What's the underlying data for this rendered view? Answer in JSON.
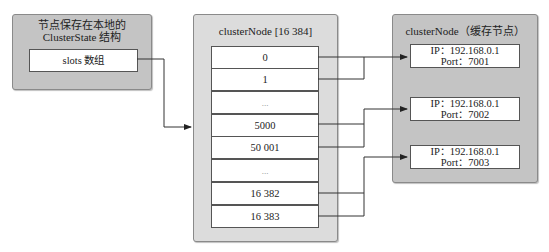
{
  "left_panel": {
    "title_line1": "节点保存在本地的",
    "title_line2": "ClusterState 结构",
    "slots_label": "slots 数组"
  },
  "middle_panel": {
    "title": "clusterNode [16 384]",
    "cells": [
      "0",
      "1",
      "...",
      "5000",
      "50 001",
      "...",
      "16 382",
      "16 383"
    ]
  },
  "right_panel": {
    "title": "clusterNode（缓存节点）",
    "nodes": [
      {
        "ip": "IP：192.168.0.1",
        "port": "Port：7001"
      },
      {
        "ip": "IP：192.168.0.1",
        "port": "Port：7002"
      },
      {
        "ip": "IP：192.168.0.1",
        "port": "Port：7003"
      }
    ]
  },
  "colors": {
    "panel_left_bg": "#c4c4c4",
    "panel_middle_bg": "#dcdcdc",
    "panel_right_bg": "#c4c4c4",
    "line": "#333333"
  }
}
